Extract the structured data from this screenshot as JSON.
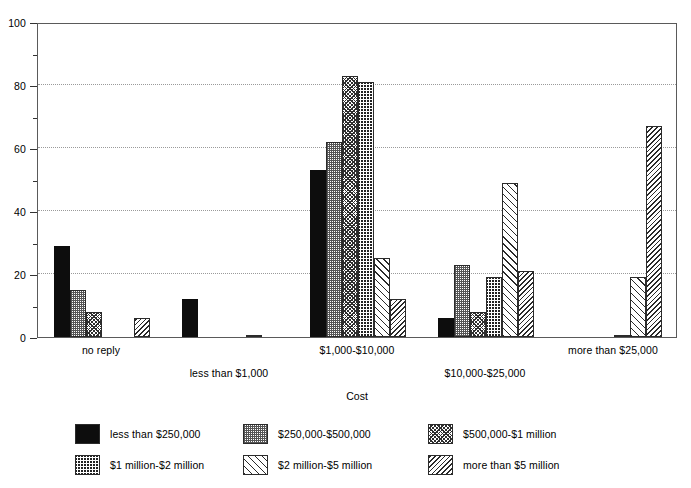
{
  "chart_data": {
    "type": "bar",
    "title": "",
    "subtitle": "",
    "xlabel": "Cost",
    "ylabel": "",
    "ylim": [
      0,
      100
    ],
    "y_ticks": [
      0,
      20,
      40,
      60,
      80,
      100
    ],
    "y_minor_ticks": [
      10,
      30,
      50,
      70,
      90
    ],
    "grid": "horizontal-dotted",
    "legend_position": "bottom",
    "grouped": true,
    "categories": [
      "no reply",
      "less than $1,000",
      "$1,000-$10,000",
      "$10,000-$25,000",
      "more than $25,000"
    ],
    "series": [
      {
        "name": "less than $250,000",
        "pattern": "solid-black",
        "values": [
          29,
          12,
          53,
          6,
          0
        ]
      },
      {
        "name": "$250,000-$500,000",
        "pattern": "fine-dots",
        "values": [
          15,
          0,
          62,
          23,
          0
        ]
      },
      {
        "name": "$500,000-$1 million",
        "pattern": "dense-crosshatch",
        "values": [
          8,
          0,
          83,
          8,
          0
        ]
      },
      {
        "name": "$1 million-$2 million",
        "pattern": "checkerboard",
        "values": [
          0,
          0,
          81,
          19,
          0.5
        ]
      },
      {
        "name": "$2 million-$5 million",
        "pattern": "diagonal-light",
        "values": [
          0,
          0.5,
          25,
          49,
          19
        ]
      },
      {
        "name": "more than $5 million",
        "pattern": "diagonal-dense",
        "values": [
          6,
          0,
          12,
          21,
          67
        ]
      }
    ]
  },
  "axis": {
    "x_title": "Cost",
    "y_tick_labels": [
      "0",
      "20",
      "40",
      "60",
      "80",
      "100"
    ]
  },
  "legend": {
    "items": [
      {
        "label": "less than $250,000",
        "pattern": "solid-black"
      },
      {
        "label": "$250,000-$500,000",
        "pattern": "fine-dots"
      },
      {
        "label": "$500,000-$1 million",
        "pattern": "dense-crosshatch"
      },
      {
        "label": "$1 million-$2 million",
        "pattern": "checkerboard"
      },
      {
        "label": "$2 million-$5 million",
        "pattern": "diagonal-light"
      },
      {
        "label": "more than $5 million",
        "pattern": "diagonal-dense"
      }
    ]
  }
}
